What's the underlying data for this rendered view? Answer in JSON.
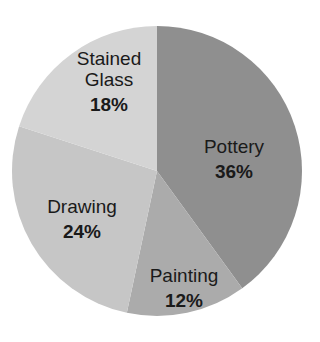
{
  "chart_data": {
    "type": "pie",
    "title": "",
    "start_angle_deg": 0,
    "direction": "clockwise",
    "center": [
      157,
      171
    ],
    "radius": 145,
    "slices": [
      {
        "label": "Pottery",
        "value": 36,
        "value_label": "36%",
        "color": "#8f8f8f",
        "label_lines": [
          "Pottery"
        ],
        "label_pos": [
          234,
          153
        ]
      },
      {
        "label": "Painting",
        "value": 12,
        "value_label": "12%",
        "color": "#ababab",
        "label_lines": [
          "Painting"
        ],
        "label_pos": [
          184,
          282
        ]
      },
      {
        "label": "Drawing",
        "value": 24,
        "value_label": "24%",
        "color": "#c6c6c6",
        "label_lines": [
          "Drawing"
        ],
        "label_pos": [
          82,
          213
        ]
      },
      {
        "label": "Stained Glass",
        "value": 18,
        "value_label": "18%",
        "color": "#d4d4d4",
        "label_lines": [
          "Stained",
          "Glass"
        ],
        "label_pos": [
          109,
          86
        ]
      }
    ],
    "categories": [
      "Pottery",
      "Painting",
      "Drawing",
      "Stained Glass"
    ],
    "values": [
      36,
      12,
      24,
      18
    ],
    "legend": "none",
    "grid": false
  }
}
